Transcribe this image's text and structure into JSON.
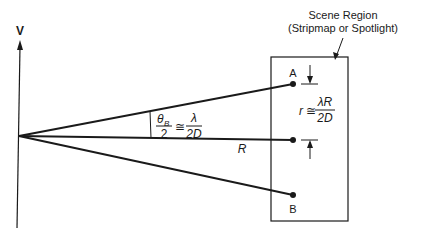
{
  "diagram": {
    "velocity_label": "V",
    "scene_label_line1": "Scene Region",
    "scene_label_line2": "(Stripmap or Spotlight)",
    "point_a_label": "A",
    "point_b_label": "B",
    "range_label": "R",
    "beam_eq": {
      "theta": "θ",
      "theta_sub": "B",
      "den_left": "2",
      "approx": "≅",
      "num_right": "λ",
      "den_right": "2D"
    },
    "resolution_eq": {
      "lhs": "r",
      "approx": "≅",
      "num": "λR",
      "den": "2D"
    },
    "colors": {
      "line": "#1a1a1a",
      "background": "#ffffff"
    }
  }
}
